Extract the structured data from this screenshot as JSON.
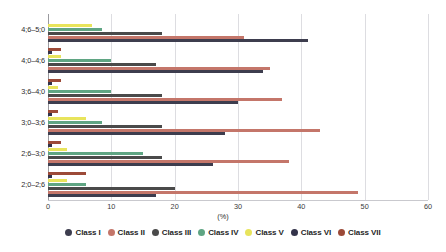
{
  "chart_data": {
    "type": "bar",
    "orientation": "horizontal",
    "title": "",
    "xlabel": "(%)",
    "ylabel": "",
    "xlim": [
      0,
      60
    ],
    "xticks": [
      0,
      10,
      20,
      30,
      40,
      50,
      60
    ],
    "grid": "vertical",
    "legend_position": "bottom",
    "categories": [
      "4;6–5;0",
      "4;0–4;6",
      "3;6–4;0",
      "3;0–3;6",
      "2;6–3;0",
      "2;0–2;6"
    ],
    "series": [
      {
        "name": "Class I",
        "color": "#3d3d4e",
        "values": [
          41.0,
          34.0,
          30.0,
          28.0,
          26.0,
          17.0
        ]
      },
      {
        "name": "Class II",
        "color": "#c4766a",
        "values": [
          31.0,
          35.0,
          37.0,
          43.0,
          38.0,
          49.0
        ]
      },
      {
        "name": "Class III",
        "color": "#4a4a4a",
        "values": [
          18.0,
          17.0,
          18.0,
          18.0,
          18.0,
          20.0
        ]
      },
      {
        "name": "Class IV",
        "color": "#5fa583",
        "values": [
          8.5,
          10.0,
          10.0,
          8.5,
          15.0,
          6.0
        ]
      },
      {
        "name": "Class V",
        "color": "#e8e45c",
        "values": [
          7.0,
          2.0,
          1.5,
          6.0,
          3.0,
          3.0
        ]
      },
      {
        "name": "Class VI",
        "color": "#33334a",
        "values": [
          0.0,
          0.6,
          0.6,
          0.6,
          0.6,
          0.6
        ]
      },
      {
        "name": "Class VII",
        "color": "#9c4a38",
        "values": [
          0.0,
          2.0,
          2.0,
          1.5,
          2.0,
          6.0
        ]
      }
    ]
  },
  "legend": {
    "items": [
      {
        "label": "Class I"
      },
      {
        "label": "Class II"
      },
      {
        "label": "Class III"
      },
      {
        "label": "Class IV"
      },
      {
        "label": "Class V"
      },
      {
        "label": "Class VI"
      },
      {
        "label": "Class VII"
      }
    ]
  },
  "axis": {
    "x_title": "(%)"
  }
}
